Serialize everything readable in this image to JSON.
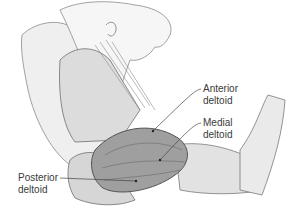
{
  "figure": {
    "labels": [
      {
        "id": "anterior",
        "line1": "Anterior",
        "line2": "deltoid",
        "x": 203,
        "y": 83,
        "pointer": {
          "x": 153,
          "y": 131
        }
      },
      {
        "id": "medial",
        "line1": "Medial",
        "line2": "deltoid",
        "x": 203,
        "y": 117,
        "pointer": {
          "x": 160,
          "y": 160
        }
      },
      {
        "id": "posterior",
        "line1": "Posterior",
        "line2": "deltoid",
        "x": 18,
        "y": 172,
        "pointer": {
          "x": 136,
          "y": 181
        }
      }
    ],
    "colors": {
      "background": "#ffffff",
      "skin_light": "#ececec",
      "muscle_mid": "#c9c9c9",
      "deltoid_fill": "#9c9c9c",
      "outline": "#5a5a5a",
      "label_text": "#3a3a3a"
    }
  }
}
